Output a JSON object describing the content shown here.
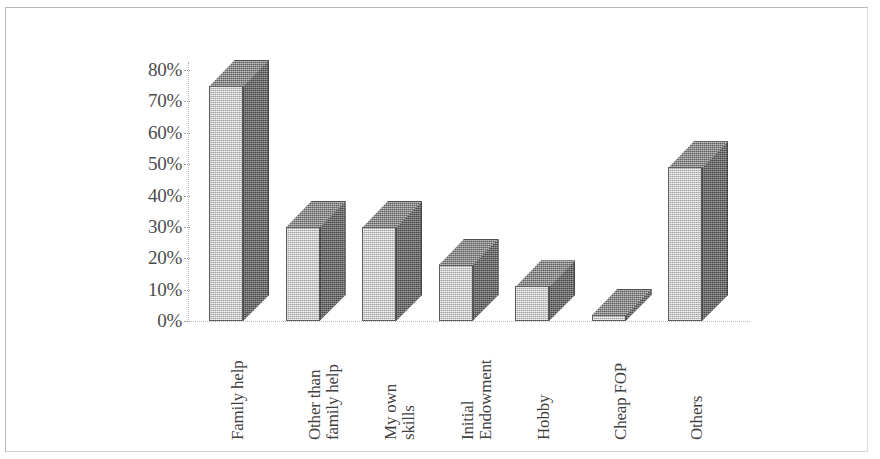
{
  "chart_data": {
    "type": "bar",
    "title": "",
    "subtitle": "",
    "xlabel": "",
    "ylabel": "",
    "categories": [
      "Family help",
      "Other than family help",
      "My own skills",
      "Initial Endowment",
      "Hobby",
      "Cheap FOP",
      "Others"
    ],
    "category_lines": [
      [
        "Family help"
      ],
      [
        "Other than",
        "family help"
      ],
      [
        "My own",
        "skills"
      ],
      [
        "Initial",
        "Endowment"
      ],
      [
        "Hobby"
      ],
      [
        "Cheap FOP"
      ],
      [
        "Others"
      ]
    ],
    "values": [
      75,
      30,
      30,
      18,
      11,
      2,
      49
    ],
    "value_labels": [
      "75%",
      "30%",
      "30%",
      "18%",
      "11%",
      "2%",
      "49%"
    ],
    "ylim": [
      0,
      80
    ],
    "y_ticks": [
      0,
      10,
      20,
      30,
      40,
      50,
      60,
      70,
      80
    ],
    "y_tick_labels": [
      "0%",
      "10%",
      "20%",
      "30%",
      "40%",
      "50%",
      "60%",
      "70%",
      "80%"
    ],
    "grid": false,
    "legend": false,
    "legend_position": "none",
    "style": "3d-bar",
    "colors": {
      "bar_front": "#c9c9c9",
      "bar_side": "#6f6f6f",
      "bar_top": "#8e8e8e",
      "bar_outline": "#5d5d5d",
      "axis": "#b5b5b5",
      "text": "#3f3f3f",
      "frame": "#b9b9b9",
      "background": "#ffffff"
    }
  },
  "figure": {
    "frame_visible": true
  }
}
